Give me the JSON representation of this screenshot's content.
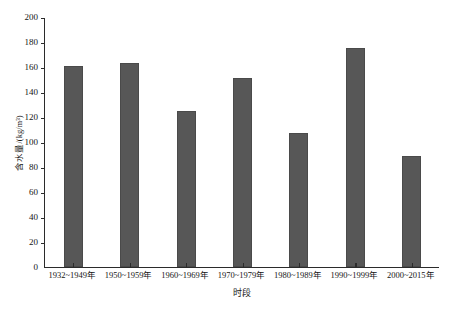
{
  "chart_data": {
    "type": "bar",
    "title": "",
    "subtitle": "",
    "xlabel": "时段",
    "ylabel": "含水量/(kg/m³)",
    "categories": [
      "1932~1949年",
      "1950~1959年",
      "1960~1969年",
      "1970~1979年",
      "1980~1989年",
      "1990~1999年",
      "2000~2015年"
    ],
    "values": [
      161,
      163,
      125,
      151,
      107,
      175,
      89
    ],
    "ylim": [
      0,
      200
    ],
    "ytick_labels": [
      "0",
      "20",
      "40",
      "60",
      "80",
      "100",
      "120",
      "140",
      "160",
      "180",
      "200"
    ],
    "ytick_values": [
      0,
      20,
      40,
      60,
      80,
      100,
      120,
      140,
      160,
      180,
      200
    ],
    "grid": "off",
    "legend": "none",
    "bar_color": "#575757",
    "axis_color": "#2b2b2b",
    "background_color": "#ffffff"
  }
}
